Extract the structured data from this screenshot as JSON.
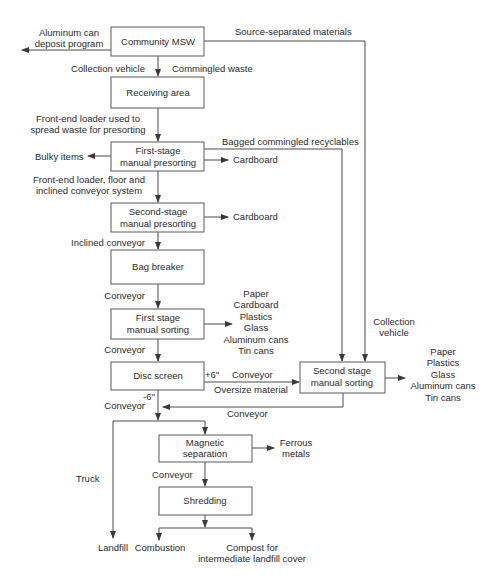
{
  "diagram": {
    "nodes": {
      "community_msw": [
        "Community MSW"
      ],
      "receiving_area": [
        "Receiving area"
      ],
      "first_stage_presorting": [
        "First-stage",
        "manual presorting"
      ],
      "second_stage_presorting": [
        "Second-stage",
        "manual presorting"
      ],
      "bag_breaker": [
        "Bag breaker"
      ],
      "first_stage_sorting": [
        "First stage",
        "manual sorting"
      ],
      "disc_screen": [
        "Disc screen"
      ],
      "second_stage_sorting": [
        "Second stage",
        "manual sorting"
      ],
      "magnetic_separation": [
        "Magnetic",
        "separation"
      ],
      "shredding": [
        "Shredding"
      ]
    },
    "labels": {
      "aluminum_can_deposit": [
        "Aluminum can",
        "deposit program"
      ],
      "source_separated": [
        "Source-separated materials"
      ],
      "collection_vehicle_1": [
        "Collection vehicle"
      ],
      "commingled_waste": [
        "Commingled waste"
      ],
      "front_end_loader_spread": [
        "Front-end loader used to",
        "spread waste for presorting"
      ],
      "bagged_commingled": [
        "Bagged commingled recyclables"
      ],
      "bulky_items": [
        "Bulky items"
      ],
      "cardboard_1": [
        "Cardboard"
      ],
      "front_end_loader_floor": [
        "Front-end loader, floor and",
        "inclined conveyor system"
      ],
      "cardboard_2": [
        "Cardboard"
      ],
      "inclined_conveyor": [
        "Inclined conveyor"
      ],
      "conveyor_1": [
        "Conveyor"
      ],
      "first_sort_outputs": [
        "Paper",
        "Cardboard",
        "Plastics",
        "Glass",
        "Aluminum cans",
        "Tin cans"
      ],
      "conveyor_2": [
        "Conveyor"
      ],
      "collection_vehicle_2": [
        "Collection",
        "vehicle"
      ],
      "plus_6": [
        "+6\""
      ],
      "conveyor_3": [
        "Conveyor"
      ],
      "oversize_material": [
        "Oversize material"
      ],
      "second_sort_outputs": [
        "Paper",
        "Plastics",
        "Glass",
        "Aluminum cans",
        "Tin cans"
      ],
      "minus_6": [
        "-6\""
      ],
      "conveyor_4": [
        "Conveyor"
      ],
      "conveyor_return": [
        "Conveyor"
      ],
      "ferrous_metals": [
        "Ferrous",
        "metals"
      ],
      "truck": [
        "Truck"
      ],
      "conveyor_5": [
        "Conveyor"
      ],
      "landfill": [
        "Landfill"
      ],
      "combustion": [
        "Combustion"
      ],
      "compost": [
        "Compost for",
        "intermediate landfill cover"
      ]
    }
  }
}
